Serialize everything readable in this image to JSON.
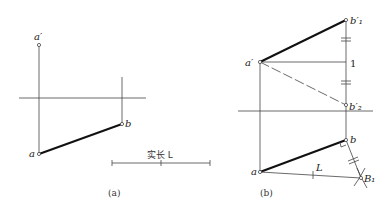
{
  "figure_a": {
    "caption": "(a)",
    "labels": {
      "a_prime": "a′",
      "a": "a",
      "b": "b"
    },
    "scale_label": "实长 L"
  },
  "figure_b": {
    "caption": "(b)",
    "labels": {
      "a_prime": "a′",
      "b1_prime": "b′₁",
      "one": "1",
      "b2_prime": "b′₂",
      "a": "a",
      "b": "b",
      "L": "L",
      "B1": "B₁"
    }
  },
  "colors": {
    "line": "#333333",
    "thick": "#111111",
    "bg": "#ffffff"
  }
}
